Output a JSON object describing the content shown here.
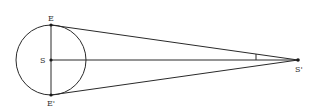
{
  "diagram": {
    "labels": {
      "E": "E",
      "S": "S",
      "E_prime": "E'",
      "S_prime": "S'"
    },
    "colors": {
      "stroke": "#2a2a2a",
      "text": "#333333",
      "background": "#ffffff"
    }
  }
}
